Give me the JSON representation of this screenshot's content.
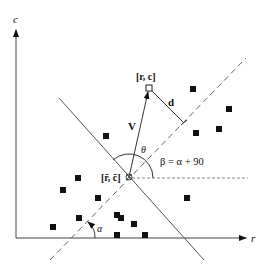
{
  "diagram": {
    "axes": {
      "vertical_label": "c",
      "horizontal_label": "r"
    },
    "labels": {
      "point_label": "[r, c]",
      "centroid_label": "[r̄, c̄]",
      "vector_label": "V",
      "distance_label": "d",
      "theta_label": "θ",
      "alpha_label": "α",
      "beta_equation": "β = α + 90"
    },
    "points": [
      [
        106,
        136
      ],
      [
        193,
        89
      ],
      [
        229,
        109
      ],
      [
        219,
        129
      ],
      [
        196,
        133
      ],
      [
        187,
        198
      ],
      [
        78,
        178
      ],
      [
        63,
        190
      ],
      [
        98,
        198
      ],
      [
        117,
        215
      ],
      [
        121,
        218
      ],
      [
        134,
        224
      ],
      [
        79,
        218
      ],
      [
        53,
        227
      ],
      [
        117,
        235
      ],
      [
        145,
        235
      ]
    ],
    "colors": {
      "ink": "#111111",
      "line": "#555555",
      "dashed": "#666666"
    }
  }
}
